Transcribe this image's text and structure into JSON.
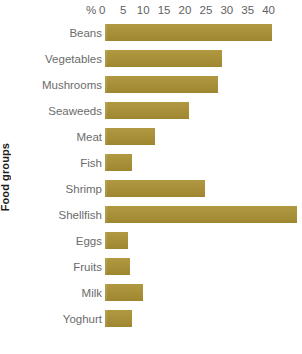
{
  "chart_data": {
    "type": "bar",
    "orientation": "horizontal",
    "title": "",
    "xlabel": "%",
    "ylabel": "Food groups",
    "categories": [
      "Beans",
      "Vegetables",
      "Mushrooms",
      "Seaweeds",
      "Meat",
      "Fish",
      "Shrimp",
      "Shellfish",
      "Eggs",
      "Fruits",
      "Milk",
      "Yoghurt"
    ],
    "values": [
      40,
      28,
      27,
      20,
      12,
      6.5,
      24,
      46,
      5.5,
      6,
      9,
      6.5
    ],
    "xlim": [
      0,
      40
    ],
    "xticks": [
      0,
      5,
      10,
      15,
      20,
      25,
      30,
      35,
      40
    ],
    "xtick_labels": [
      "0",
      "5",
      "10",
      "15",
      "20",
      "25",
      "30",
      "35",
      "40"
    ],
    "grid": false,
    "legend": null,
    "bar_color": "#ab9134"
  },
  "axis": {
    "percent_symbol": "%",
    "y_title": "Food groups"
  },
  "colors": {
    "bar": "#ab9134",
    "label_text": "#6b6b6b",
    "tick_text": "#5f5f5f",
    "axis_title": "#1c1c1c",
    "background": "#ffffff"
  }
}
